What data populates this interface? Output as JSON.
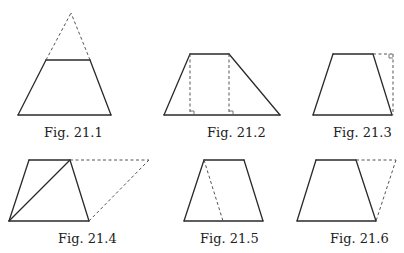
{
  "figures": [
    {
      "id": "21.1",
      "caption": "Fig. 21.1",
      "caption_pos": [
        44,
        133
      ],
      "solid": [
        [
          [
            18,
            115
          ],
          [
            111,
            115
          ]
        ],
        [
          [
            18,
            115
          ],
          [
            46,
            60
          ]
        ],
        [
          [
            111,
            115
          ],
          [
            90,
            60
          ]
        ],
        [
          [
            46,
            60
          ],
          [
            90,
            60
          ]
        ]
      ],
      "dashed": [
        [
          [
            46,
            60
          ],
          [
            71,
            13
          ]
        ],
        [
          [
            90,
            60
          ],
          [
            71,
            13
          ]
        ]
      ]
    },
    {
      "id": "21.2",
      "caption": "Fig. 21.2",
      "caption_pos": [
        207,
        133
      ],
      "solid": [
        [
          [
            164,
            115
          ],
          [
            280,
            115
          ]
        ],
        [
          [
            164,
            115
          ],
          [
            190,
            54
          ]
        ],
        [
          [
            190,
            54
          ],
          [
            229,
            54
          ]
        ],
        [
          [
            229,
            54
          ],
          [
            280,
            115
          ]
        ]
      ],
      "dashed": [
        [
          [
            190,
            54
          ],
          [
            190,
            115
          ]
        ],
        [
          [
            229,
            54
          ],
          [
            229,
            115
          ]
        ]
      ],
      "right_angles": [
        [
          190,
          115,
          "r"
        ],
        [
          229,
          115,
          "r"
        ]
      ]
    },
    {
      "id": "21.3",
      "caption": "Fig. 21.3",
      "caption_pos": [
        333,
        133
      ],
      "solid": [
        [
          [
            313,
            115
          ],
          [
            392,
            115
          ]
        ],
        [
          [
            313,
            115
          ],
          [
            333,
            54
          ]
        ],
        [
          [
            333,
            54
          ],
          [
            373,
            54
          ]
        ],
        [
          [
            373,
            54
          ],
          [
            392,
            115
          ]
        ]
      ],
      "dashed": [
        [
          [
            373,
            54
          ],
          [
            393,
            54
          ]
        ],
        [
          [
            393,
            54
          ],
          [
            393,
            115
          ]
        ]
      ],
      "right_angles": [
        [
          393,
          54,
          "tl"
        ]
      ]
    },
    {
      "id": "21.4",
      "caption": "Fig. 21.4",
      "caption_pos": [
        58,
        238
      ],
      "solid": [
        [
          [
            9,
            221
          ],
          [
            89,
            221
          ]
        ],
        [
          [
            9,
            221
          ],
          [
            29,
            160
          ]
        ],
        [
          [
            29,
            160
          ],
          [
            70,
            160
          ]
        ],
        [
          [
            70,
            160
          ],
          [
            89,
            221
          ]
        ],
        [
          [
            9,
            221
          ],
          [
            70,
            160
          ]
        ]
      ],
      "dashed": [
        [
          [
            70,
            160
          ],
          [
            149,
            160
          ]
        ],
        [
          [
            149,
            160
          ],
          [
            89,
            221
          ]
        ]
      ]
    },
    {
      "id": "21.5",
      "caption": "Fig. 21.5",
      "caption_pos": [
        200,
        238
      ],
      "solid": [
        [
          [
            184,
            221
          ],
          [
            263,
            221
          ]
        ],
        [
          [
            184,
            221
          ],
          [
            204,
            160
          ]
        ],
        [
          [
            204,
            160
          ],
          [
            244,
            160
          ]
        ],
        [
          [
            244,
            160
          ],
          [
            263,
            221
          ]
        ]
      ],
      "dashed": [
        [
          [
            204,
            160
          ],
          [
            223,
            221
          ]
        ]
      ]
    },
    {
      "id": "21.6",
      "caption": "Fig. 21.6",
      "caption_pos": [
        330,
        238
      ],
      "solid": [
        [
          [
            297,
            221
          ],
          [
            376,
            221
          ]
        ],
        [
          [
            297,
            221
          ],
          [
            316,
            160
          ]
        ],
        [
          [
            316,
            160
          ],
          [
            356,
            160
          ]
        ],
        [
          [
            356,
            160
          ],
          [
            376,
            221
          ]
        ]
      ],
      "dashed": [
        [
          [
            356,
            160
          ],
          [
            396,
            160
          ]
        ],
        [
          [
            396,
            160
          ],
          [
            376,
            221
          ]
        ]
      ]
    }
  ],
  "colors": {
    "stroke": "#2a2a2a",
    "dashed": "#555555",
    "caption": "#222222"
  }
}
